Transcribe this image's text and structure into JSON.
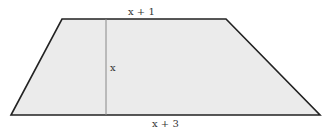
{
  "diagram": {
    "shape": "trapezoid",
    "fill_color": "#ebebeb",
    "stroke_color": "#222222",
    "height_line_color": "#888888",
    "labels": {
      "top": "x + 1",
      "height": "x",
      "bottom": "x + 3"
    }
  }
}
